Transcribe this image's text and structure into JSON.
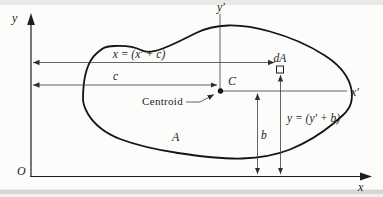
{
  "figure": {
    "colors": {
      "background": "#fcfcfa",
      "ink": "#1c1c1c",
      "scan_edge_top": "#e9e9e7",
      "scan_edge_bottom": "#d7d7d5"
    },
    "labels": {
      "y_axis": "y",
      "x_axis": "x",
      "origin": "O",
      "y_prime_axis": "y′",
      "x_prime_axis": "x′",
      "centroid_point": "C",
      "centroid_caption": "Centroid",
      "area": "A",
      "area_element": "dA",
      "dim_x_total": "x = (x′ + c)",
      "dim_c": "c",
      "dim_y_total": "y = (y′ + b)",
      "dim_b": "b"
    }
  }
}
